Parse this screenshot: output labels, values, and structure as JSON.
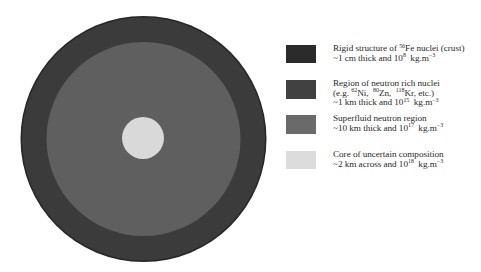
{
  "diagram": {
    "center": {
      "x": 143.5,
      "y": 139
    },
    "layers": [
      {
        "name": "crust",
        "radius": 123,
        "color": "#3b3b3b",
        "edge_color": "#262626"
      },
      {
        "name": "superfluid",
        "radius": 97,
        "color": "#5f5f5f"
      },
      {
        "name": "core",
        "radius": 21,
        "color": "#d9d9d9"
      }
    ]
  },
  "legend": {
    "items": [
      {
        "swatch_color": "#2b2b2b",
        "line1_pre": "Rigid structure of ",
        "line1_sup": "56",
        "line1_post": "Fe nuclei (crust)",
        "line2_pre": "~1 cm thick and 10",
        "line2_sup": "8",
        "line2_post": "  kg.m",
        "line2_unit_sup": "−3"
      },
      {
        "swatch_color": "#414141",
        "line1": "Region of neutron rich nuclei",
        "line2_a": "(e.g. ",
        "line2_sup1": "62",
        "line2_b": "Ni,  ",
        "line2_sup2": "80",
        "line2_c": "Zn,  ",
        "line2_sup3": "118",
        "line2_d": "Kr, etc.)",
        "line3_pre": "~1 km thick and 10",
        "line3_sup": "15",
        "line3_post": "  kg.m",
        "line3_unit_sup": "−3"
      },
      {
        "swatch_color": "#6a6a6a",
        "line1": "Superfluid neutron region",
        "line2_pre": "~10 km thick and 10",
        "line2_sup": "17",
        "line2_post": "  kg.m",
        "line2_unit_sup": "−3"
      },
      {
        "swatch_color": "#dcdcdc",
        "line1": "Core of uncertain composition",
        "line2_pre": "~2 km across and 10",
        "line2_sup": "18",
        "line2_post": "  kg.m",
        "line2_unit_sup": "−3"
      }
    ]
  }
}
